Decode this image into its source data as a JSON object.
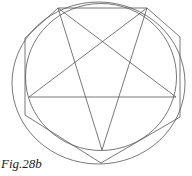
{
  "caption": "Fig.28b",
  "colors": {
    "stroke": "#555555",
    "text": "#222222",
    "background": "#ffffff"
  },
  "diagram": {
    "elements": [
      "outer-ellipse",
      "inner-circle",
      "pentagram",
      "hexagon"
    ]
  }
}
